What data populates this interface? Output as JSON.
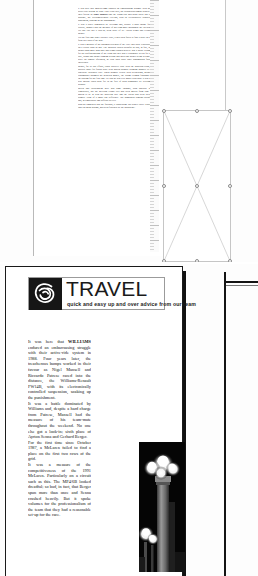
{
  "app": {
    "name": "desktop-publishing-layout-view",
    "background_color": "#fdfdfd"
  },
  "page_one": {
    "name": "page-one",
    "text_column": {
      "paragraphs": [
        "It was here that <b>WILLIAMS</b> endured an embarrassing struggle with their active-ride system in 1988. Four years later, the treacherous bumps worked in their favour as <b>Nigel Mansell</b> and the Senna-less McLarens raced into the distance, the Williams-Renault FW14B, with its electronically controlled suspension, soaking up the punishment.",
        "It was a battle dominated by Williams and, despite a hard charge from Patrese, Mansell had the measure of his team-mate throughout the weekend. No one else got a look-in; sixth place of all Ayrton Senna and Gerhard Berger.",
        "For the first time since October 1987, a McLaren failed to find a place on the front two rows of the grid.",
        "It was a measure of the uncompetitiveness of the 1991 McLaren. Particularly on a circuit such as this. The MP4/6B looked dreadful as bad, in fact, that Berger spun more than once and Senna crashed heavily. But it spoke volumes for the professionalism of the team that they had a reasonable set-up for the race, Senna and Berger running second and third and Berger being willing to drive on Sunday afternoon, he took third place until transmission failure intervened.",
        "Berger, for all his efforts, could scarcely cope with the Benetton-Fords, a spirited tussle for fourth place with Martin Brundle bringing Mansell to an otherwise lacklustre race. When Brundle retired with overheating, Michael Schumacher assumed the Benetton mantle, the young German finishing on the podium for the first time. He said he was very happy with third. It was the best anyone could hope for in the face of such dominance by Williams-Renault.",
        "Berlin and Hockenheim have had some changes, both physical and climatically, but the Mexican Grand Prix had been moved from June to March to be in with the Brazilian race and the circuit had been altered slightly. None of it made any difference. The bumpiness remains dreadful and, in temperature and difficult as ever.",
        "Run-out suggested that the footbath, a loadbearing 180 degree curve leading onto the main straight, had been flattened by the subsidence."
      ]
    },
    "picture_frame": {
      "name": "empty-picture-frame",
      "state": "selected",
      "handle_count": 8
    },
    "ruler": {
      "name": "vertical-ruler",
      "orientation": "vertical"
    }
  },
  "page_two": {
    "name": "page-two",
    "masthead": {
      "title": "TRAVEL",
      "tagline": "quick and easy up and over advice from our team",
      "logo": "spiral-knot-logo"
    },
    "text_column": {
      "paragraphs": [
        "It was here that <b>WILLIAMS</b> endured an embarrassing struggle with their active-ride system in 1988. Four years later, the treacherous bumps worked in their favour as Nigel Mansell and Riccardo Patrese raced into the distance, the Williams-Renault FW14B, with its electronically controlled suspension, soaking up the punishment.",
        "It was a battle dominated by Williams and, despite a hard charge from Patrese, Mansell had the measure of his team-mate throughout the weekend. No one else got a look-in; sixth place of Ayrton Senna and Gerhard Berger.",
        "For the first time since October 1987, a McLaren failed to find a place on the first two rows of the grid.",
        "It was a measure of the competitiveness of the 1991 McLaren. Particularly on a circuit such as this. The MP4/6B looked dreadful; so bad, in fact, that Berger spun more than once and Senna crashed heavily. But it spoke volumes for the professionalism of the team that they had a reasonable set-up for the race."
      ]
    },
    "photo": {
      "name": "night-lamps-photograph",
      "description": "dark night photograph with bright street lamps"
    }
  },
  "right_object": {
    "name": "adjacent-page-object"
  }
}
